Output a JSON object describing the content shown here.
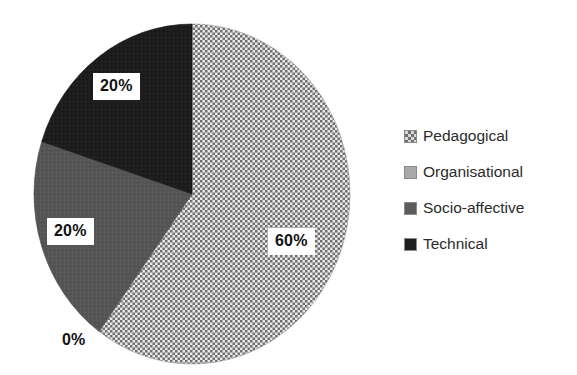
{
  "chart_data": {
    "type": "pie",
    "title": "",
    "categories": [
      "Pedagogical",
      "Organisational",
      "Socio-affective",
      "Technical"
    ],
    "values": [
      60,
      0,
      20,
      20
    ],
    "value_labels": [
      "60%",
      "0%",
      "20%",
      "20%"
    ],
    "units": "percent",
    "start_angle_deg": 0,
    "direction": "clockwise",
    "legend_position": "right",
    "grid": false,
    "colors": [
      "#d8d8d8",
      "#a9a9a9",
      "#5c5c5c",
      "#1f1f1f"
    ],
    "patterns": [
      "checkered-dots",
      "solid-light-gray",
      "solid-medium-gray",
      "solid-near-black"
    ],
    "slices": [
      {
        "label": "Pedagogical",
        "value": 60,
        "display": "60%",
        "color": "#d8d8d8",
        "pattern": "checkered-dots",
        "start_deg": 0,
        "end_deg": 216
      },
      {
        "label": "Organisational",
        "value": 0,
        "display": "0%",
        "color": "#a9a9a9",
        "pattern": "solid-light-gray",
        "start_deg": 216,
        "end_deg": 216
      },
      {
        "label": "Socio-affective",
        "value": 20,
        "display": "20%",
        "color": "#5c5c5c",
        "pattern": "solid-medium-gray",
        "start_deg": 216,
        "end_deg": 288
      },
      {
        "label": "Technical",
        "value": 20,
        "display": "20%",
        "color": "#1f1f1f",
        "pattern": "solid-near-black",
        "start_deg": 288,
        "end_deg": 360
      }
    ]
  },
  "labels": {
    "pedagogical": "60%",
    "organisational": "0%",
    "socio_affective": "20%",
    "technical": "20%"
  },
  "legend": {
    "items": [
      {
        "label": "Pedagogical",
        "swatch": "pedagogical-swatch-icon"
      },
      {
        "label": "Organisational",
        "swatch": "organisational-swatch-icon"
      },
      {
        "label": "Socio-affective",
        "swatch": "socio-affective-swatch-icon"
      },
      {
        "label": "Technical",
        "swatch": "technical-swatch-icon"
      }
    ]
  }
}
